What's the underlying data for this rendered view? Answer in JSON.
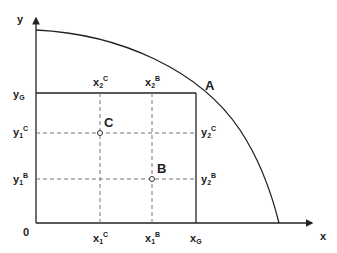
{
  "diagram": {
    "axes": {
      "x_label": "x",
      "y_label": "y",
      "origin_label": "0"
    },
    "points": {
      "A": {
        "label": "A"
      },
      "B": {
        "label": "B"
      },
      "C": {
        "label": "C"
      }
    },
    "labels": {
      "yG": {
        "base": "y",
        "sub": "G",
        "sup": ""
      },
      "y1C": {
        "base": "y",
        "sub": "1",
        "sup": "C"
      },
      "y1B": {
        "base": "y",
        "sub": "1",
        "sup": "B"
      },
      "y2C": {
        "base": "y",
        "sub": "2",
        "sup": "C"
      },
      "y2B": {
        "base": "y",
        "sub": "2",
        "sup": "B"
      },
      "x2C": {
        "base": "x",
        "sub": "2",
        "sup": "C"
      },
      "x2B": {
        "base": "x",
        "sub": "2",
        "sup": "B"
      },
      "x1C": {
        "base": "x",
        "sub": "1",
        "sup": "C"
      },
      "x1B": {
        "base": "x",
        "sub": "1",
        "sup": "B"
      },
      "xG": {
        "base": "x",
        "sub": "G",
        "sup": ""
      }
    },
    "colors": {
      "line": "#222222",
      "dashed": "#666666"
    }
  }
}
